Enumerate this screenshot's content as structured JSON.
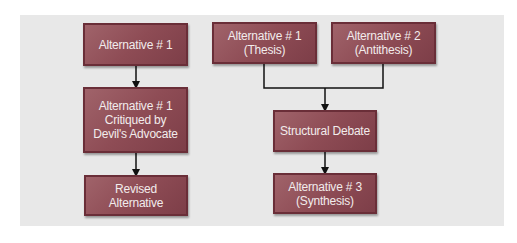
{
  "diagram": {
    "left_flow": {
      "nodes": [
        {
          "id": "alt1",
          "label": "Alternative # 1"
        },
        {
          "id": "alt1-critiqued",
          "label": "Alternative # 1\nCritiqued by\nDevil's Advocate"
        },
        {
          "id": "revised",
          "label": "Revised\nAlternative"
        }
      ],
      "edges": [
        [
          "alt1",
          "alt1-critiqued"
        ],
        [
          "alt1-critiqued",
          "revised"
        ]
      ]
    },
    "right_flow": {
      "nodes": [
        {
          "id": "thesis",
          "label": "Alternative # 1\n(Thesis)"
        },
        {
          "id": "antithesis",
          "label": "Alternative # 2\n(Antithesis)"
        },
        {
          "id": "debate",
          "label": "Structural Debate"
        },
        {
          "id": "synthesis",
          "label": "Alternative # 3\n(Synthesis)"
        }
      ],
      "edges": [
        [
          "thesis",
          "debate"
        ],
        [
          "antithesis",
          "debate"
        ],
        [
          "debate",
          "synthesis"
        ]
      ]
    },
    "colors": {
      "box_fill": "#8e4c55",
      "box_border": "#6a2e38",
      "box_text": "#f2ecec",
      "panel": "#e8e8e8",
      "connector": "#111111"
    }
  }
}
